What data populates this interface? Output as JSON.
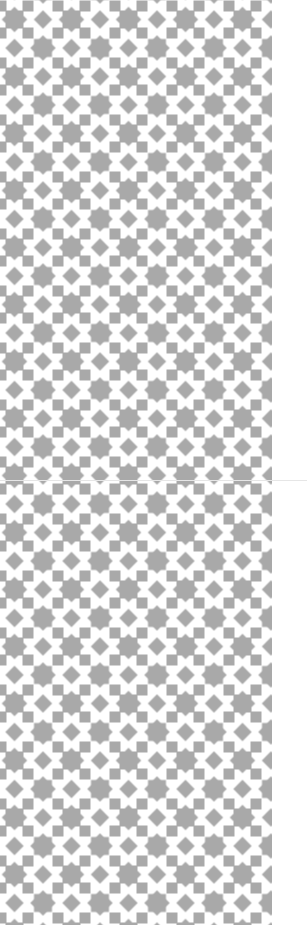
{
  "image": {
    "description": "Decorative geometric tile pattern of gray eight-pointed stars, diamonds and squares on white",
    "width": 307,
    "height": 925,
    "pattern_width": 272,
    "tile_size": 57,
    "colors": {
      "background": "#ffffff",
      "shape": "#a9a9a9",
      "seam": "#e6e6e6"
    },
    "seam_y": 480
  }
}
